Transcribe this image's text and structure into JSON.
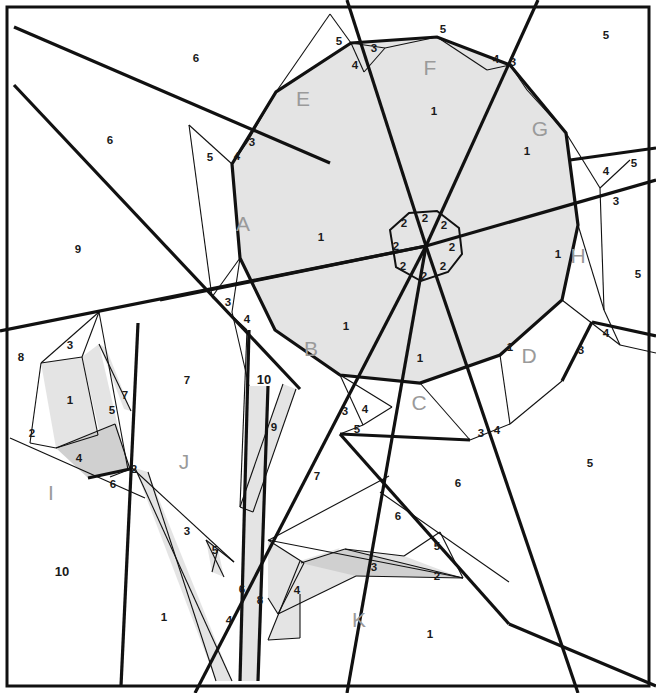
{
  "figure": {
    "type": "geometric-dissection",
    "canvas": {
      "width": 656,
      "height": 693
    },
    "colors": {
      "background": "#ffffff",
      "line": "#111111",
      "shade_light": "#e4e4e4",
      "shade_dark": "#d0d0d0",
      "letter_label": "#9a9a9a",
      "number_label": "#1a1a1a"
    }
  },
  "region_labels": [
    {
      "id": "A",
      "text": "A",
      "x": 243,
      "y": 225
    },
    {
      "id": "B",
      "text": "B",
      "x": 311,
      "y": 350
    },
    {
      "id": "C",
      "text": "C",
      "x": 419,
      "y": 404
    },
    {
      "id": "D",
      "text": "D",
      "x": 529,
      "y": 357
    },
    {
      "id": "E",
      "text": "E",
      "x": 303,
      "y": 100
    },
    {
      "id": "F",
      "text": "F",
      "x": 430,
      "y": 69
    },
    {
      "id": "G",
      "text": "G",
      "x": 540,
      "y": 130
    },
    {
      "id": "H",
      "text": "H",
      "x": 578,
      "y": 257
    },
    {
      "id": "I",
      "text": "I",
      "x": 51,
      "y": 494
    },
    {
      "id": "J",
      "text": "J",
      "x": 184,
      "y": 463
    },
    {
      "id": "K",
      "text": "K",
      "x": 359,
      "y": 621
    }
  ],
  "number_labels": [
    {
      "text": "6",
      "x": 196,
      "y": 59
    },
    {
      "text": "5",
      "x": 443,
      "y": 30
    },
    {
      "text": "5",
      "x": 339,
      "y": 42
    },
    {
      "text": "3",
      "x": 374,
      "y": 49
    },
    {
      "text": "4",
      "x": 355,
      "y": 66
    },
    {
      "text": "4",
      "x": 496,
      "y": 60
    },
    {
      "text": "3",
      "x": 513,
      "y": 63
    },
    {
      "text": "5",
      "x": 606,
      "y": 36
    },
    {
      "text": "6",
      "x": 110,
      "y": 141
    },
    {
      "text": "5",
      "x": 210,
      "y": 158
    },
    {
      "text": "4",
      "x": 237,
      "y": 157
    },
    {
      "text": "3",
      "x": 252,
      "y": 143
    },
    {
      "text": "1",
      "x": 321,
      "y": 238
    },
    {
      "text": "1",
      "x": 434,
      "y": 112
    },
    {
      "text": "1",
      "x": 527,
      "y": 152
    },
    {
      "text": "4",
      "x": 606,
      "y": 172
    },
    {
      "text": "3",
      "x": 616,
      "y": 202
    },
    {
      "text": "5",
      "x": 634,
      "y": 164
    },
    {
      "text": "5",
      "x": 638,
      "y": 275
    },
    {
      "text": "1",
      "x": 558,
      "y": 255
    },
    {
      "text": "9",
      "x": 78,
      "y": 250
    },
    {
      "text": "2",
      "x": 404,
      "y": 224
    },
    {
      "text": "2",
      "x": 425,
      "y": 219
    },
    {
      "text": "2",
      "x": 444,
      "y": 226
    },
    {
      "text": "2",
      "x": 452,
      "y": 248
    },
    {
      "text": "2",
      "x": 443,
      "y": 267
    },
    {
      "text": "2",
      "x": 424,
      "y": 277
    },
    {
      "text": "2",
      "x": 403,
      "y": 267
    },
    {
      "text": "2",
      "x": 396,
      "y": 247
    },
    {
      "text": "3",
      "x": 228,
      "y": 303
    },
    {
      "text": "4",
      "x": 247,
      "y": 320
    },
    {
      "text": "1",
      "x": 346,
      "y": 327
    },
    {
      "text": "1",
      "x": 420,
      "y": 359
    },
    {
      "text": "1",
      "x": 510,
      "y": 348
    },
    {
      "text": "3",
      "x": 581,
      "y": 351
    },
    {
      "text": "4",
      "x": 606,
      "y": 334
    },
    {
      "text": "8",
      "x": 21,
      "y": 358
    },
    {
      "text": "3",
      "x": 70,
      "y": 346
    },
    {
      "text": "1",
      "x": 70,
      "y": 401
    },
    {
      "text": "2",
      "x": 32,
      "y": 434
    },
    {
      "text": "4",
      "x": 79,
      "y": 459
    },
    {
      "text": "5",
      "x": 112,
      "y": 411
    },
    {
      "text": "7",
      "x": 125,
      "y": 396
    },
    {
      "text": "6",
      "x": 113,
      "y": 485
    },
    {
      "text": "2",
      "x": 134,
      "y": 470
    },
    {
      "text": "7",
      "x": 187,
      "y": 381
    },
    {
      "text": "10",
      "x": 264,
      "y": 381
    },
    {
      "text": "9",
      "x": 274,
      "y": 428
    },
    {
      "text": "3",
      "x": 345,
      "y": 412
    },
    {
      "text": "4",
      "x": 365,
      "y": 410
    },
    {
      "text": "5",
      "x": 357,
      "y": 430
    },
    {
      "text": "3",
      "x": 481,
      "y": 434
    },
    {
      "text": "4",
      "x": 497,
      "y": 431
    },
    {
      "text": "7",
      "x": 317,
      "y": 477
    },
    {
      "text": "6",
      "x": 458,
      "y": 484
    },
    {
      "text": "5",
      "x": 590,
      "y": 464
    },
    {
      "text": "10",
      "x": 62,
      "y": 573
    },
    {
      "text": "1",
      "x": 164,
      "y": 618
    },
    {
      "text": "3",
      "x": 187,
      "y": 532
    },
    {
      "text": "5",
      "x": 215,
      "y": 551
    },
    {
      "text": "6",
      "x": 242,
      "y": 590
    },
    {
      "text": "4",
      "x": 229,
      "y": 621
    },
    {
      "text": "8",
      "x": 260,
      "y": 601
    },
    {
      "text": "6",
      "x": 398,
      "y": 517
    },
    {
      "text": "5",
      "x": 437,
      "y": 547
    },
    {
      "text": "4",
      "x": 297,
      "y": 591
    },
    {
      "text": "3",
      "x": 374,
      "y": 568
    },
    {
      "text": "2",
      "x": 437,
      "y": 577
    },
    {
      "text": "1",
      "x": 430,
      "y": 635
    }
  ]
}
